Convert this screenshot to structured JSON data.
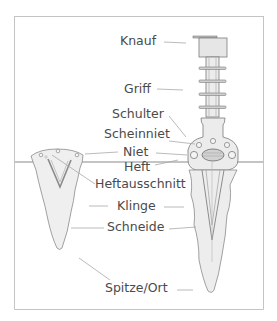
{
  "diagram": {
    "type": "labeled-illustration",
    "labels": [
      {
        "id": "knauf",
        "text": "Knauf"
      },
      {
        "id": "griff",
        "text": "Griff"
      },
      {
        "id": "schulter",
        "text": "Schulter"
      },
      {
        "id": "scheinniet",
        "text": "Scheinniet"
      },
      {
        "id": "niet",
        "text": "Niet"
      },
      {
        "id": "heft",
        "text": "Heft"
      },
      {
        "id": "heftausschnitt",
        "text": "Heftausschnitt"
      },
      {
        "id": "klinge",
        "text": "Klinge"
      },
      {
        "id": "schneide",
        "text": "Schneide"
      },
      {
        "id": "spitze",
        "text": "Spitze/Ort"
      }
    ],
    "colors": {
      "text": "#4a4a4a",
      "leader": "#a8a8a8",
      "outline": "#7a7a7a",
      "fill": "#ebebeb",
      "frame": "#c4c4c4"
    }
  }
}
